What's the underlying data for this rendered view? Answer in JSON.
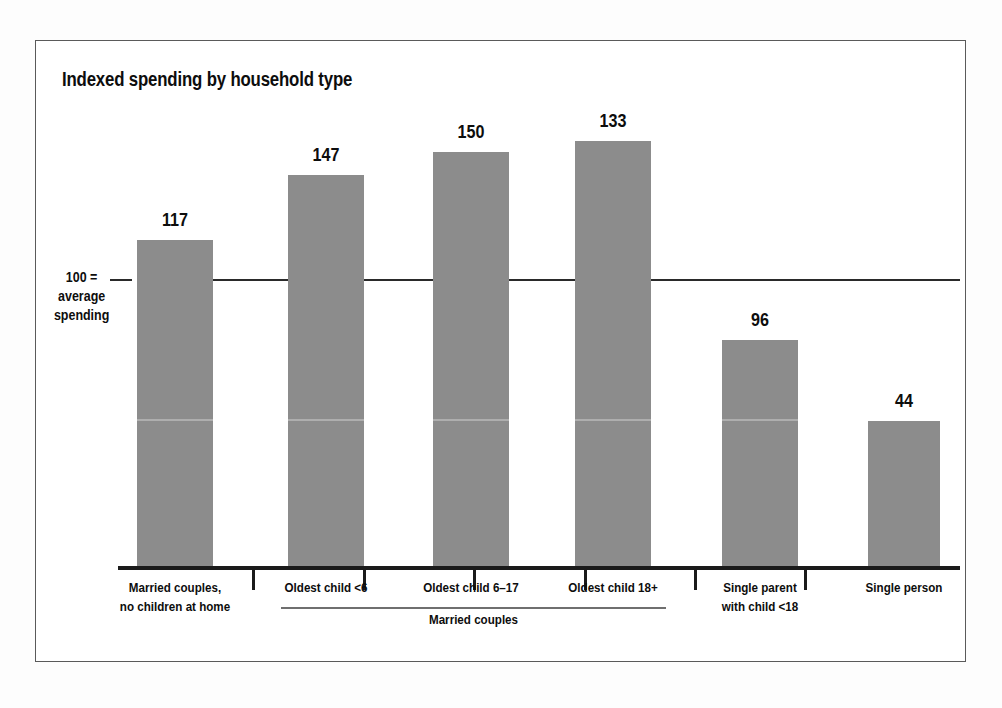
{
  "figure": {
    "title": "Indexed spending by household type",
    "axis_reference_label_line1": "100 =",
    "axis_reference_label_line2": "average",
    "axis_reference_label_line3": "spending",
    "group_label": "Married couples",
    "bar_color": "#8c8c8c",
    "frame_color": "#5a5a5a",
    "axis_color": "#1b1b1b"
  },
  "chart_data": {
    "type": "bar",
    "title": "Indexed spending by household type",
    "xlabel": "",
    "ylabel": "Indexed spending (100 = average spending)",
    "reference_line": 100,
    "reference_line_label": "100 = average spending",
    "ylim": [
      0,
      160
    ],
    "grid": false,
    "legend": "none",
    "categories": [
      "Married couples, no children at home",
      "Oldest child <6",
      "Oldest child 6–17",
      "Oldest child 18+",
      "Single parent with child <18",
      "Single person"
    ],
    "values": [
      117,
      147,
      150,
      133,
      96,
      44
    ],
    "group_brackets": [
      {
        "label": "Married couples",
        "covers": [
          "Oldest child <6",
          "Oldest child 6–17",
          "Oldest child 18+"
        ]
      }
    ]
  },
  "bars": [
    {
      "value_label": "117",
      "cat_line1": "Married couples,",
      "cat_line2": "no children at home",
      "left": 137,
      "width": 76,
      "top": 240,
      "height": 328,
      "value_left": 117,
      "value_width": 116,
      "value_top": 209,
      "cat_left": 107,
      "cat_width": 136
    },
    {
      "value_label": "147",
      "cat_line1": "Oldest child <6",
      "cat_line2": "",
      "left": 288,
      "width": 76,
      "top": 175,
      "height": 393,
      "value_left": 268,
      "value_width": 116,
      "value_top": 144,
      "cat_left": 258,
      "cat_width": 136
    },
    {
      "value_label": "150",
      "cat_line1": "Oldest child 6–17",
      "cat_line2": "",
      "left": 433,
      "width": 76,
      "top": 152,
      "height": 416,
      "value_left": 413,
      "value_width": 116,
      "value_top": 121,
      "cat_left": 403,
      "cat_width": 136
    },
    {
      "value_label": "133",
      "cat_line1": "Oldest child 18+",
      "cat_line2": "",
      "left": 575,
      "width": 76,
      "top": 141,
      "height": 427,
      "value_left": 555,
      "value_width": 116,
      "value_top": 110,
      "cat_left": 545,
      "cat_width": 136
    },
    {
      "value_label": "96",
      "cat_line1": "Single parent",
      "cat_line2": "with child <18",
      "left": 722,
      "width": 76,
      "top": 340,
      "height": 228,
      "value_left": 702,
      "value_width": 116,
      "value_top": 309,
      "cat_left": 692,
      "cat_width": 136
    },
    {
      "value_label": "44",
      "cat_line1": "Single person",
      "cat_line2": "",
      "left": 868,
      "width": 72,
      "top": 421,
      "height": 147,
      "value_left": 846,
      "value_width": 116,
      "value_top": 390,
      "cat_left": 836,
      "cat_width": 136
    }
  ],
  "ticks": [
    252,
    363,
    473,
    584,
    694,
    804
  ]
}
